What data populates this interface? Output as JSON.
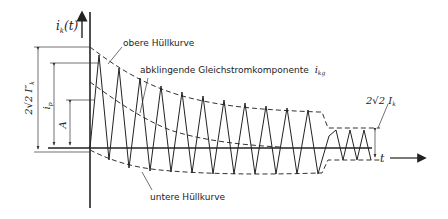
{
  "diagram": {
    "type": "short-circuit current waveform",
    "axis_y_label": "i",
    "axis_y_sub": "k",
    "axis_y_arg": "(t)",
    "axis_x_label": "t",
    "labels": {
      "upper_envelope": "obere Hüllkurve",
      "dc_component": "abklingende Gleichstromkomponente",
      "dc_symbol": "i",
      "dc_symbol_sub": "kg",
      "lower_envelope": "untere Hüllkurve"
    },
    "dimensions": {
      "peak_initial": "2√2 I″",
      "peak_initial_sub": "k",
      "peak_current": "i",
      "peak_current_sub": "p",
      "dc_initial": "A",
      "steady_state": "2√2 I",
      "steady_state_sub": "k"
    }
  }
}
